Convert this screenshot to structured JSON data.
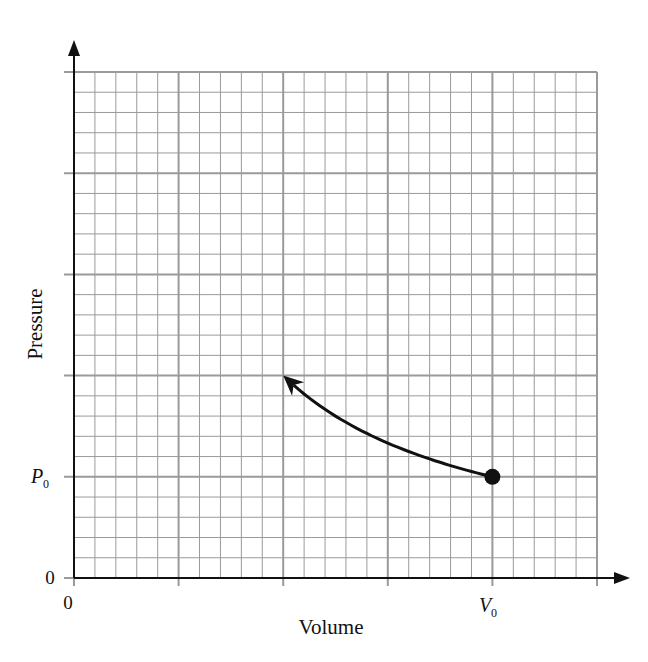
{
  "chart_data": {
    "type": "line",
    "title": "",
    "xlabel": "Volume",
    "ylabel": "Pressure",
    "x_ticks": [
      {
        "value": 0,
        "label": "0"
      },
      {
        "value": 1,
        "label": "V0"
      }
    ],
    "y_ticks": [
      {
        "value": 0,
        "label": "0"
      },
      {
        "value": 1,
        "label": "P0"
      }
    ],
    "x_tick_label_main": "V",
    "x_tick_label_sub": "0",
    "y_tick_label_main": "P",
    "y_tick_label_sub": "0",
    "xlim": [
      0,
      1.2
    ],
    "ylim": [
      0,
      5
    ],
    "grid": {
      "major_divisions_x": 5,
      "major_divisions_y": 5,
      "minor_per_major": 5,
      "color": "#9a9a9a"
    },
    "series": [
      {
        "name": "process path",
        "description": "Curved path from start point (V0, P0) to arrow tip (0.5 V0, 2 P0)",
        "start": {
          "x": 1.0,
          "y": 1.0,
          "marker": "filled-dot"
        },
        "end": {
          "x": 0.5,
          "y": 2.0,
          "marker": "arrowhead"
        },
        "points": [
          [
            1.0,
            1.0
          ],
          [
            0.9,
            1.11
          ],
          [
            0.8,
            1.25
          ],
          [
            0.7,
            1.43
          ],
          [
            0.6,
            1.67
          ],
          [
            0.5,
            2.0
          ]
        ]
      }
    ],
    "legend": null
  },
  "labels": {
    "x_origin": "0",
    "y_origin": "0",
    "xlabel": "Volume",
    "ylabel": "Pressure",
    "v0_main": "V",
    "v0_sub": "0",
    "p0_main": "P",
    "p0_sub": "0"
  }
}
